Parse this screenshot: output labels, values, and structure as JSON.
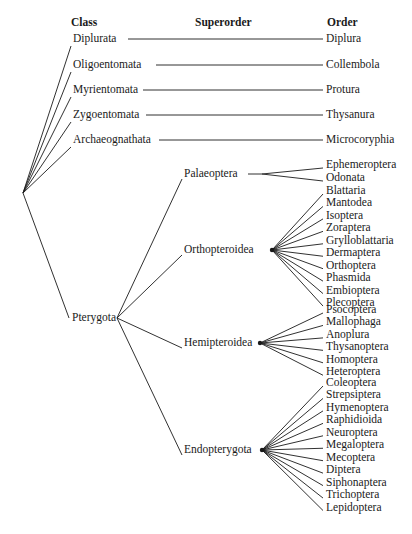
{
  "headers": {
    "class": "Class",
    "superorder": "Superorder",
    "order": "Order"
  },
  "classes": [
    {
      "name": "Diplurata",
      "order": "Diplura"
    },
    {
      "name": "Oligoentomata",
      "order": "Collembola"
    },
    {
      "name": "Myrientomata",
      "order": "Protura"
    },
    {
      "name": "Zygoentomata",
      "order": "Thysanura"
    },
    {
      "name": "Archaeognathata",
      "order": "Microcoryphia"
    },
    {
      "name": "Pterygota"
    }
  ],
  "superorders": [
    {
      "name": "Palaeoptera",
      "orders": [
        "Ephemeroptera",
        "Odonata"
      ]
    },
    {
      "name": "Orthopteroidea",
      "orders": [
        "Blattaria",
        "Mantodea",
        "Isoptera",
        "Zoraptera",
        "Grylloblattaria",
        "Dermaptera",
        "Orthoptera",
        "Phasmida",
        "Embioptera",
        "Plecoptera"
      ]
    },
    {
      "name": "Hemipteroidea",
      "orders": [
        "Psocoptera",
        "Mallophaga",
        "Anoplura",
        "Thysanoptera",
        "Homoptera",
        "Heteroptera"
      ]
    },
    {
      "name": "Endopterygota",
      "orders": [
        "Coleoptera",
        "Strepsiptera",
        "Hymenoptera",
        "Raphidioida",
        "Neuroptera",
        "Megaloptera",
        "Mecoptera",
        "Diptera",
        "Siphonaptera",
        "Trichoptera",
        "Lepidoptera"
      ]
    }
  ]
}
